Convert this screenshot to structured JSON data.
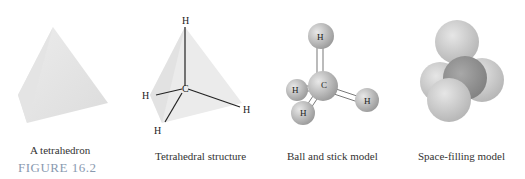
{
  "figure": {
    "label": "FIGURE 16.2",
    "panels": [
      {
        "id": "tetrahedron",
        "caption": "A tetrahedron"
      },
      {
        "id": "tetrahedral-structure",
        "caption": "Tetrahedral structure",
        "atoms": {
          "center": "C",
          "top": "H",
          "left": "H",
          "right": "H",
          "bottom": "H"
        }
      },
      {
        "id": "ball-and-stick",
        "caption": "Ball and stick model",
        "atoms": {
          "center": "C",
          "top": "H",
          "left": "H",
          "right": "H",
          "bottom": "H"
        }
      },
      {
        "id": "space-filling",
        "caption": "Space-filling model"
      }
    ]
  },
  "colors": {
    "tetra_fill": "#e6e6e6",
    "ball_light": "#e0e0e0",
    "ball_dark": "#9a9a9a",
    "label": "#8a9ab0"
  }
}
